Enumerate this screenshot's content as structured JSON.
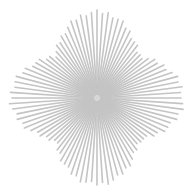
{
  "graphic": {
    "type": "starburst",
    "description": "radial gray line burst",
    "center": [
      97,
      98
    ],
    "line_count": 96,
    "inner_radius": 4,
    "axis_radius": 86,
    "diagonal_radius": 60,
    "line_color": "#c4c4c4",
    "center_glow_color": "#d0d0d0",
    "line_width": 1.6,
    "background": "#ffffff"
  }
}
